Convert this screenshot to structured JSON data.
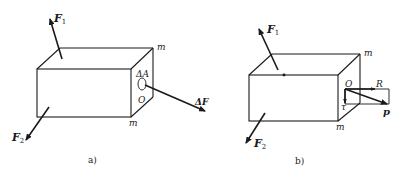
{
  "figure": {
    "panel_a": {
      "caption": "a)",
      "labels": {
        "force_1_main": "F",
        "force_1_sub": "1",
        "force_2_main": "F",
        "force_2_sub": "2",
        "section_top": "m",
        "section_bottom": "m",
        "area": "ΔA",
        "point": "O",
        "area_force": "ΔF"
      }
    },
    "panel_b": {
      "caption": "b)",
      "labels": {
        "force_1_main": "F",
        "force_1_sub": "1",
        "force_2_main": "F",
        "force_2_sub": "2",
        "section_top": "m",
        "section_bottom": "m",
        "point": "O",
        "normal_stress": "R",
        "shear_stress": "τ",
        "total_stress": "p"
      }
    },
    "colors": {
      "line": "#1a1a1a",
      "background": "#ffffff"
    }
  }
}
